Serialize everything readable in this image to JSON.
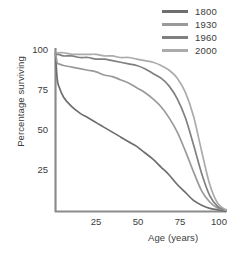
{
  "chart_data": {
    "type": "line",
    "title": "",
    "xlabel": "Age (years)",
    "ylabel": "Percentage surviving",
    "xlim": [
      0,
      105
    ],
    "ylim": [
      0,
      103
    ],
    "xticks": [
      25,
      50,
      75,
      100
    ],
    "yticks": [
      25,
      50,
      75,
      100
    ],
    "grid": false,
    "legend_position": "top-right",
    "axis_color": "#8c8c8c",
    "x": [
      0,
      1,
      2,
      5,
      10,
      15,
      20,
      25,
      30,
      35,
      40,
      45,
      50,
      55,
      60,
      65,
      70,
      75,
      80,
      85,
      90,
      95,
      100,
      105
    ],
    "series": [
      {
        "name": "1800",
        "color": "#6e6e6e",
        "values": [
          100,
          84,
          79,
          72,
          66,
          62,
          59,
          56,
          53,
          50,
          47,
          44,
          41,
          37,
          33,
          28,
          23,
          17,
          12,
          7,
          4,
          2,
          1,
          0
        ]
      },
      {
        "name": "1930",
        "color": "#9a9a9a",
        "values": [
          100,
          94,
          93,
          92,
          91,
          90,
          89,
          88,
          86,
          85,
          83,
          81,
          78,
          75,
          71,
          66,
          59,
          50,
          38,
          25,
          13,
          6,
          2,
          1
        ]
      },
      {
        "name": "1960",
        "color": "#808080",
        "values": [
          100,
          99,
          99,
          98,
          98,
          97,
          97,
          96,
          96,
          95,
          94,
          93,
          92,
          90,
          87,
          84,
          79,
          71,
          59,
          42,
          24,
          10,
          3,
          1
        ]
      },
      {
        "name": "2000",
        "color": "#ababab",
        "values": [
          100,
          100,
          100,
          100,
          99,
          99,
          99,
          99,
          98,
          98,
          97,
          97,
          96,
          95,
          94,
          92,
          89,
          84,
          75,
          60,
          38,
          17,
          5,
          1
        ]
      }
    ]
  },
  "legend": {
    "entries": [
      {
        "label": "1800",
        "color": "#6e6e6e"
      },
      {
        "label": "1930",
        "color": "#9a9a9a"
      },
      {
        "label": "1960",
        "color": "#808080"
      },
      {
        "label": "2000",
        "color": "#ababab"
      }
    ]
  },
  "axes": {
    "y_title": "Percentage surviving",
    "x_title": "Age (years)",
    "y_tick_labels": [
      "100",
      "75",
      "50",
      "25"
    ],
    "x_tick_labels": [
      "25",
      "50",
      "75",
      "100"
    ]
  }
}
